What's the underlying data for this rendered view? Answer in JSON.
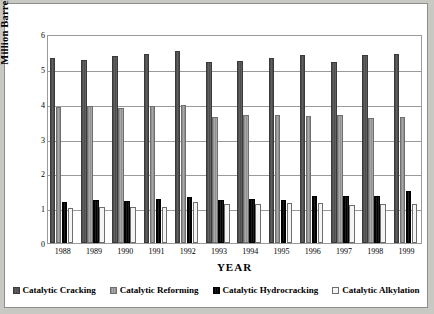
{
  "chart_data": {
    "type": "bar",
    "title": "",
    "xlabel": "YEAR",
    "ylabel": "Million Barrels per Day",
    "ylim": [
      0,
      6
    ],
    "yticks": [
      0,
      1,
      2,
      3,
      4,
      5,
      6
    ],
    "grid": true,
    "legend_position": "bottom",
    "categories": [
      "1988",
      "1989",
      "1990",
      "1991",
      "1992",
      "1993",
      "1994",
      "1995",
      "1996",
      "1997",
      "1998",
      "1999"
    ],
    "series": [
      {
        "name": "Catalytic Cracking",
        "color": "#575757",
        "values": [
          5.32,
          5.25,
          5.36,
          5.44,
          5.52,
          5.2,
          5.22,
          5.32,
          5.39,
          5.19,
          5.41,
          5.43
        ]
      },
      {
        "name": "Catalytic Reforming",
        "color": "#9d9d9d",
        "values": [
          3.9,
          3.92,
          3.88,
          3.92,
          3.95,
          3.61,
          3.67,
          3.67,
          3.65,
          3.68,
          3.58,
          3.61
        ]
      },
      {
        "name": "Catalytic Hydrocracking",
        "color": "#000000",
        "values": [
          1.19,
          1.23,
          1.2,
          1.26,
          1.31,
          1.23,
          1.25,
          1.24,
          1.34,
          1.36,
          1.35,
          1.5
        ]
      },
      {
        "name": "Catalytic Alkylation",
        "color": "#f4f4f4",
        "values": [
          1.0,
          1.03,
          1.04,
          1.04,
          1.19,
          1.12,
          1.12,
          1.16,
          1.16,
          1.09,
          1.11,
          1.12
        ]
      }
    ]
  }
}
